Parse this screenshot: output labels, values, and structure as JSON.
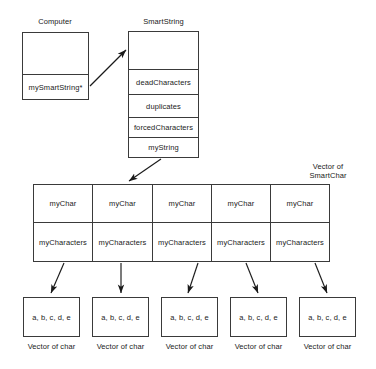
{
  "diagram": {
    "title_labels": {
      "computer": "Computer",
      "smartstring": "SmartString",
      "vector_of_smartchar_line1": "Vector of",
      "vector_of_smartchar_line2": "SmartChar"
    },
    "computer_box": {
      "empty_cell": "",
      "pointer_cell": "mySmartString*"
    },
    "smartstring_box": {
      "cells": [
        {
          "label": ""
        },
        {
          "label": "deadCharacters"
        },
        {
          "label": "duplicates"
        },
        {
          "label": "forcedCharacters"
        },
        {
          "label": "myString"
        }
      ]
    },
    "smartchar_vector": {
      "columns": [
        {
          "top": "myChar",
          "bottom": "myCharacters"
        },
        {
          "top": "myChar",
          "bottom": "myCharacters"
        },
        {
          "top": "myChar",
          "bottom": "myCharacters"
        },
        {
          "top": "myChar",
          "bottom": "myCharacters"
        },
        {
          "top": "myChar",
          "bottom": "myCharacters"
        }
      ]
    },
    "char_vectors": [
      {
        "contents": "a, b, c, d, e",
        "caption": "Vector of char"
      },
      {
        "contents": "a, b, c, d, e",
        "caption": "Vector of char"
      },
      {
        "contents": "a, b, c, d, e",
        "caption": "Vector of char"
      },
      {
        "contents": "a, b, c, d, e",
        "caption": "Vector of char"
      },
      {
        "contents": "a, b, c, d, e",
        "caption": "Vector of char"
      }
    ],
    "colors": {
      "stroke": "#3a3a3a",
      "arrow": "#1a1a1a",
      "text": "#1a1a1a",
      "background": "#ffffff"
    }
  }
}
